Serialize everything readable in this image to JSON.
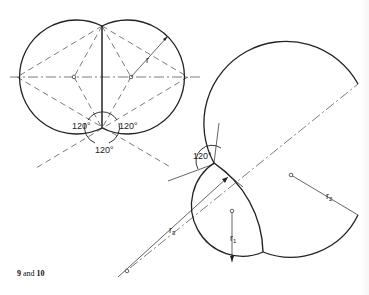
{
  "figure": {
    "left_diagram": {
      "angle_labels": [
        "120°",
        "120°",
        "120°"
      ],
      "radius_label": "r"
    },
    "right_diagram": {
      "angle_label": "120°",
      "radius_labels": {
        "r1": "r",
        "r1_sub": "1",
        "r2": "r",
        "r2_sub": "2",
        "r3": "r",
        "r3_sub": "3"
      }
    },
    "caption": {
      "num1": "9",
      "joiner": " and ",
      "num2": "10"
    }
  },
  "colors": {
    "ink": "#222222",
    "background": "#ffffff"
  }
}
